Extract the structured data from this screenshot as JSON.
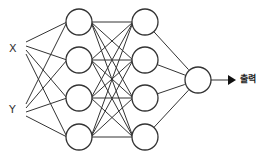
{
  "diagram": {
    "inputs": [
      {
        "label": "X",
        "x": 14,
        "y": 48
      },
      {
        "label": "Y",
        "x": 14,
        "y": 110
      }
    ],
    "hidden_layers": [
      {
        "name": "hidden-1",
        "x": 79,
        "nodes_y": [
          22,
          60,
          98,
          137
        ]
      },
      {
        "name": "hidden-2",
        "x": 145,
        "nodes_y": [
          22,
          60,
          98,
          137
        ]
      }
    ],
    "output_node": {
      "x": 198,
      "y": 80
    },
    "output_label": "출력",
    "node_radius": 13,
    "stroke_color": "#333333"
  }
}
